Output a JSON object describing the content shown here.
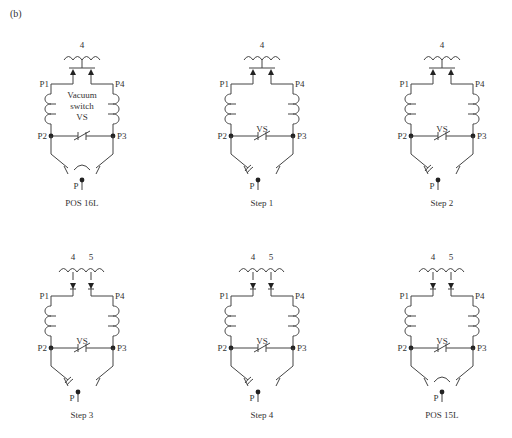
{
  "figure_label": "(b)",
  "panels": [
    {
      "id": "pos16l",
      "caption": "POS 16L",
      "taps": [
        "4"
      ],
      "arrow_dir": "up",
      "show_vs_text": true,
      "vs_text": [
        "Vacuum",
        "switch",
        "VS"
      ],
      "selector": "center",
      "labels": {
        "p1": "P1",
        "p2": "P2",
        "p3": "P3",
        "p4": "P4",
        "p": "P"
      }
    },
    {
      "id": "step1",
      "caption": "Step 1",
      "taps": [
        "4"
      ],
      "arrow_dir": "up",
      "show_vs_text": false,
      "vs_text": [
        "VS"
      ],
      "selector": "left",
      "labels": {
        "p1": "P1",
        "p2": "P2",
        "p3": "P3",
        "p4": "P4",
        "p": "P"
      }
    },
    {
      "id": "step2",
      "caption": "Step 2",
      "taps": [
        "4"
      ],
      "arrow_dir": "up",
      "show_vs_text": false,
      "vs_text": [
        "VS"
      ],
      "selector": "left",
      "labels": {
        "p1": "P1",
        "p2": "P2",
        "p3": "P3",
        "p4": "P4",
        "p": "P"
      }
    },
    {
      "id": "step3",
      "caption": "Step 3",
      "taps": [
        "4",
        "5"
      ],
      "arrow_dir": "down",
      "show_vs_text": false,
      "vs_text": [
        "VS"
      ],
      "selector": "left",
      "labels": {
        "p1": "P1",
        "p2": "P2",
        "p3": "P3",
        "p4": "P4",
        "p": "P"
      }
    },
    {
      "id": "step4",
      "caption": "Step 4",
      "taps": [
        "4",
        "5"
      ],
      "arrow_dir": "down",
      "show_vs_text": false,
      "vs_text": [
        "VS"
      ],
      "selector": "left",
      "labels": {
        "p1": "P1",
        "p2": "P2",
        "p3": "P3",
        "p4": "P4",
        "p": "P"
      }
    },
    {
      "id": "pos15l",
      "caption": "POS 15L",
      "taps": [
        "4",
        "5"
      ],
      "arrow_dir": "down",
      "show_vs_text": false,
      "vs_text": [
        "VS"
      ],
      "selector": "center",
      "labels": {
        "p1": "P1",
        "p2": "P2",
        "p3": "P3",
        "p4": "P4",
        "p": "P"
      }
    }
  ],
  "colors": {
    "line": "#444444",
    "dot": "#222222",
    "text": "#333333",
    "background": "#ffffff"
  }
}
